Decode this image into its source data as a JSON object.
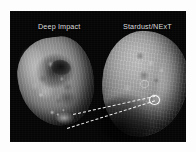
{
  "figure": {
    "name": "comet-nucleus-comparison",
    "background_color": "#fdfdfd",
    "panel_color": "#050505",
    "panel": {
      "x": 10,
      "y": 11,
      "width": 176,
      "height": 131
    }
  },
  "captions": {
    "left": "Deep Impact",
    "right": "Stardust/NExT",
    "color": "#dcdcdc"
  },
  "panels": [
    {
      "id": "left-nucleus",
      "label": "Deep Impact",
      "subject": "comet-nucleus",
      "icon": "comet-nucleus-icon"
    },
    {
      "id": "right-nucleus",
      "label": "Stardust/NExT",
      "subject": "comet-nucleus",
      "icon": "comet-nucleus-icon"
    }
  ],
  "annotations": {
    "leader_lines": [
      {
        "name": "leader-line-upper",
        "style": "dashed",
        "color": "#f2f2f2"
      },
      {
        "name": "leader-line-lower",
        "style": "dashed",
        "color": "#f2f2f2"
      }
    ],
    "markers": [
      {
        "name": "impact-crater-ring",
        "shape": "circle",
        "color": "#ffffff"
      },
      {
        "name": "secondary-crater-ring",
        "shape": "circle",
        "color": "#ebebeb"
      }
    ]
  }
}
